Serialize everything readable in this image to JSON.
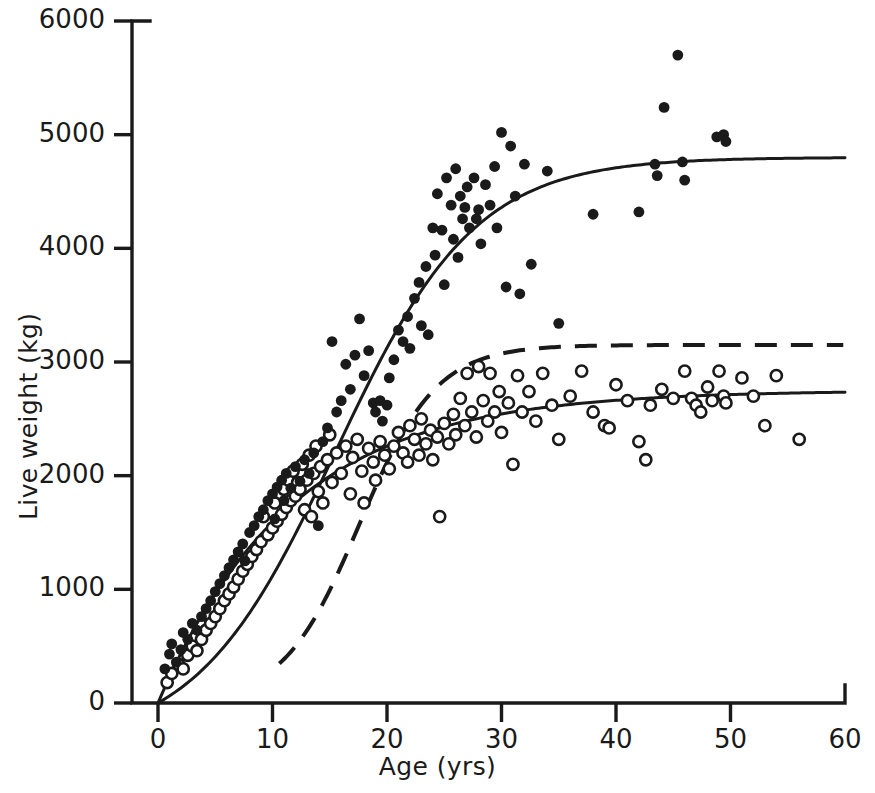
{
  "figure": {
    "kind": "scatter-with-fitted-growth-curves",
    "background_color": "#ffffff",
    "ink_color": "#1a1a1a"
  },
  "chart_data": {
    "type": "scatter",
    "title": "",
    "subtitle": "",
    "xlabel": "Age (yrs)",
    "ylabel": "Live weight (kg)",
    "xlim": [
      0,
      60
    ],
    "ylim": [
      0,
      6000
    ],
    "xticks": [
      0,
      10,
      20,
      30,
      40,
      50,
      60
    ],
    "yticks": [
      0,
      1000,
      2000,
      3000,
      4000,
      5000,
      6000
    ],
    "xtick_labels": [
      "0",
      "10",
      "20",
      "30",
      "40",
      "50",
      "60"
    ],
    "ytick_labels": [
      "0",
      "1000",
      "2000",
      "3000",
      "4000",
      "5000",
      "6000"
    ],
    "grid": false,
    "legend": "none",
    "axis_style": "L-shaped spine with outward ticks",
    "series": [
      {
        "name": "males",
        "marker": "filled-circle",
        "marker_color": "#1a1a1a",
        "marker_size": 9,
        "points": [
          [
            0.6,
            300
          ],
          [
            1.0,
            430
          ],
          [
            1.2,
            520
          ],
          [
            1.6,
            360
          ],
          [
            2.0,
            470
          ],
          [
            2.2,
            620
          ],
          [
            2.6,
            560
          ],
          [
            3.0,
            700
          ],
          [
            3.4,
            640
          ],
          [
            3.8,
            760
          ],
          [
            4.2,
            830
          ],
          [
            4.6,
            900
          ],
          [
            5.0,
            980
          ],
          [
            5.4,
            1050
          ],
          [
            5.8,
            1120
          ],
          [
            6.2,
            1190
          ],
          [
            6.6,
            1260
          ],
          [
            7.0,
            1330
          ],
          [
            7.4,
            1400
          ],
          [
            7.6,
            1250
          ],
          [
            8.0,
            1500
          ],
          [
            8.4,
            1560
          ],
          [
            8.8,
            1640
          ],
          [
            9.2,
            1700
          ],
          [
            9.6,
            1780
          ],
          [
            10.0,
            1840
          ],
          [
            10.2,
            1620
          ],
          [
            10.4,
            1900
          ],
          [
            10.8,
            1960
          ],
          [
            11.0,
            1780
          ],
          [
            11.2,
            2020
          ],
          [
            11.6,
            1890
          ],
          [
            12.0,
            2080
          ],
          [
            12.4,
            1950
          ],
          [
            12.8,
            2140
          ],
          [
            13.2,
            2020
          ],
          [
            13.6,
            2200
          ],
          [
            14.0,
            1560
          ],
          [
            14.4,
            2300
          ],
          [
            14.8,
            2420
          ],
          [
            15.2,
            3180
          ],
          [
            15.6,
            2560
          ],
          [
            16.0,
            2660
          ],
          [
            16.4,
            2980
          ],
          [
            16.8,
            2760
          ],
          [
            17.2,
            3060
          ],
          [
            17.6,
            3380
          ],
          [
            18.0,
            2880
          ],
          [
            18.4,
            3100
          ],
          [
            18.8,
            2640
          ],
          [
            19.0,
            2560
          ],
          [
            19.4,
            2660
          ],
          [
            19.6,
            2480
          ],
          [
            20.0,
            2620
          ],
          [
            20.2,
            2860
          ],
          [
            20.6,
            3020
          ],
          [
            21.0,
            3280
          ],
          [
            21.4,
            3180
          ],
          [
            21.8,
            3400
          ],
          [
            22.0,
            3120
          ],
          [
            22.4,
            3560
          ],
          [
            22.8,
            3700
          ],
          [
            23.0,
            3320
          ],
          [
            23.4,
            3840
          ],
          [
            23.6,
            3240
          ],
          [
            24.0,
            4180
          ],
          [
            24.2,
            3940
          ],
          [
            24.4,
            4480
          ],
          [
            24.8,
            4160
          ],
          [
            25.0,
            3680
          ],
          [
            25.2,
            4620
          ],
          [
            25.6,
            4380
          ],
          [
            25.8,
            4080
          ],
          [
            26.0,
            4700
          ],
          [
            26.2,
            3920
          ],
          [
            26.4,
            4460
          ],
          [
            26.6,
            4260
          ],
          [
            26.8,
            4360
          ],
          [
            27.0,
            4540
          ],
          [
            27.2,
            4180
          ],
          [
            27.6,
            4620
          ],
          [
            27.8,
            4260
          ],
          [
            28.0,
            4340
          ],
          [
            28.2,
            4040
          ],
          [
            28.6,
            4560
          ],
          [
            29.0,
            4380
          ],
          [
            29.4,
            4720
          ],
          [
            29.6,
            4180
          ],
          [
            30.0,
            5020
          ],
          [
            30.4,
            3660
          ],
          [
            30.8,
            4900
          ],
          [
            31.2,
            4460
          ],
          [
            31.6,
            3600
          ],
          [
            32.0,
            4740
          ],
          [
            32.6,
            3860
          ],
          [
            34.0,
            4680
          ],
          [
            35.0,
            3340
          ],
          [
            38.0,
            4300
          ],
          [
            42.0,
            4320
          ],
          [
            43.4,
            4740
          ],
          [
            43.6,
            4640
          ],
          [
            44.2,
            5240
          ],
          [
            45.4,
            5700
          ],
          [
            45.8,
            4760
          ],
          [
            46.0,
            4600
          ],
          [
            48.8,
            4980
          ],
          [
            49.4,
            5000
          ],
          [
            49.6,
            4940
          ]
        ]
      },
      {
        "name": "females",
        "marker": "open-circle",
        "marker_color": "#ffffff",
        "marker_edge_color": "#1a1a1a",
        "marker_size": 9,
        "points": [
          [
            0.8,
            180
          ],
          [
            1.2,
            260
          ],
          [
            1.8,
            340
          ],
          [
            2.2,
            300
          ],
          [
            2.6,
            420
          ],
          [
            3.0,
            500
          ],
          [
            3.4,
            460
          ],
          [
            3.8,
            560
          ],
          [
            4.2,
            640
          ],
          [
            4.6,
            700
          ],
          [
            5.0,
            760
          ],
          [
            5.4,
            830
          ],
          [
            5.8,
            900
          ],
          [
            6.2,
            960
          ],
          [
            6.6,
            1020
          ],
          [
            7.0,
            1090
          ],
          [
            7.4,
            1160
          ],
          [
            7.8,
            1220
          ],
          [
            8.2,
            1290
          ],
          [
            8.6,
            1350
          ],
          [
            9.0,
            1420
          ],
          [
            9.2,
            1640
          ],
          [
            9.6,
            1480
          ],
          [
            10.0,
            1540
          ],
          [
            10.2,
            1760
          ],
          [
            10.4,
            1600
          ],
          [
            10.8,
            1660
          ],
          [
            11.0,
            1880
          ],
          [
            11.2,
            1720
          ],
          [
            11.4,
            1960
          ],
          [
            11.6,
            1780
          ],
          [
            11.8,
            2040
          ],
          [
            12.0,
            1820
          ],
          [
            12.2,
            1940
          ],
          [
            12.4,
            1880
          ],
          [
            12.6,
            2100
          ],
          [
            12.8,
            1700
          ],
          [
            13.0,
            1960
          ],
          [
            13.2,
            2180
          ],
          [
            13.4,
            1640
          ],
          [
            13.6,
            2020
          ],
          [
            13.8,
            2260
          ],
          [
            14.0,
            1860
          ],
          [
            14.2,
            2080
          ],
          [
            14.4,
            1760
          ],
          [
            14.8,
            2140
          ],
          [
            15.0,
            2360
          ],
          [
            15.2,
            1940
          ],
          [
            15.6,
            2200
          ],
          [
            16.0,
            2020
          ],
          [
            16.4,
            2260
          ],
          [
            16.8,
            1840
          ],
          [
            17.0,
            2160
          ],
          [
            17.4,
            2320
          ],
          [
            17.8,
            2040
          ],
          [
            18.0,
            1760
          ],
          [
            18.4,
            2240
          ],
          [
            18.8,
            2120
          ],
          [
            19.0,
            1960
          ],
          [
            19.4,
            2300
          ],
          [
            19.8,
            2180
          ],
          [
            20.2,
            2060
          ],
          [
            20.6,
            2260
          ],
          [
            21.0,
            2380
          ],
          [
            21.4,
            2200
          ],
          [
            21.8,
            2120
          ],
          [
            22.0,
            2440
          ],
          [
            22.4,
            2320
          ],
          [
            22.8,
            2180
          ],
          [
            23.0,
            2500
          ],
          [
            23.4,
            2280
          ],
          [
            23.8,
            2400
          ],
          [
            24.0,
            2140
          ],
          [
            24.4,
            2340
          ],
          [
            24.6,
            1640
          ],
          [
            25.0,
            2460
          ],
          [
            25.4,
            2280
          ],
          [
            25.8,
            2540
          ],
          [
            26.0,
            2360
          ],
          [
            26.4,
            2680
          ],
          [
            26.8,
            2440
          ],
          [
            27.0,
            2900
          ],
          [
            27.4,
            2560
          ],
          [
            27.8,
            2340
          ],
          [
            28.0,
            2960
          ],
          [
            28.4,
            2660
          ],
          [
            28.8,
            2480
          ],
          [
            29.0,
            2900
          ],
          [
            29.4,
            2560
          ],
          [
            29.8,
            2740
          ],
          [
            30.0,
            2380
          ],
          [
            30.6,
            2640
          ],
          [
            31.0,
            2100
          ],
          [
            31.4,
            2880
          ],
          [
            31.8,
            2560
          ],
          [
            32.4,
            2740
          ],
          [
            33.0,
            2480
          ],
          [
            33.6,
            2900
          ],
          [
            34.4,
            2620
          ],
          [
            35.0,
            2320
          ],
          [
            36.0,
            2700
          ],
          [
            37.0,
            2920
          ],
          [
            38.0,
            2560
          ],
          [
            39.0,
            2440
          ],
          [
            39.4,
            2420
          ],
          [
            40.0,
            2800
          ],
          [
            41.0,
            2660
          ],
          [
            42.0,
            2300
          ],
          [
            42.6,
            2140
          ],
          [
            43.0,
            2620
          ],
          [
            44.0,
            2760
          ],
          [
            45.0,
            2680
          ],
          [
            46.0,
            2920
          ],
          [
            46.6,
            2680
          ],
          [
            47.0,
            2620
          ],
          [
            47.4,
            2560
          ],
          [
            48.0,
            2780
          ],
          [
            48.4,
            2660
          ],
          [
            49.0,
            2920
          ],
          [
            49.4,
            2700
          ],
          [
            49.6,
            2640
          ],
          [
            51.0,
            2860
          ],
          [
            52.0,
            2700
          ],
          [
            53.0,
            2440
          ],
          [
            54.0,
            2880
          ],
          [
            56.0,
            2320
          ]
        ]
      }
    ],
    "curves": [
      {
        "name": "male-growth-curve",
        "style": "solid",
        "color": "#1a1a1a",
        "width": 3,
        "asymptote": 4800,
        "description": "sigmoid fitted curve rising from origin, inflection near age 21, plateau ~4800 kg"
      },
      {
        "name": "female-growth-curve",
        "style": "solid",
        "color": "#1a1a1a",
        "width": 3,
        "asymptote": 2750,
        "description": "monomolecular fitted curve rising from origin, plateau ~2750 kg"
      },
      {
        "name": "dashed-reference-curve",
        "style": "dashed",
        "color": "#1a1a1a",
        "width": 4,
        "asymptote": 3150,
        "onset_age": 11,
        "description": "steep sigmoid starting at age ~11, plateau ~3150 kg"
      }
    ]
  },
  "axes": {
    "x_title": "Age (yrs)",
    "y_title": "Live weight (kg)"
  }
}
